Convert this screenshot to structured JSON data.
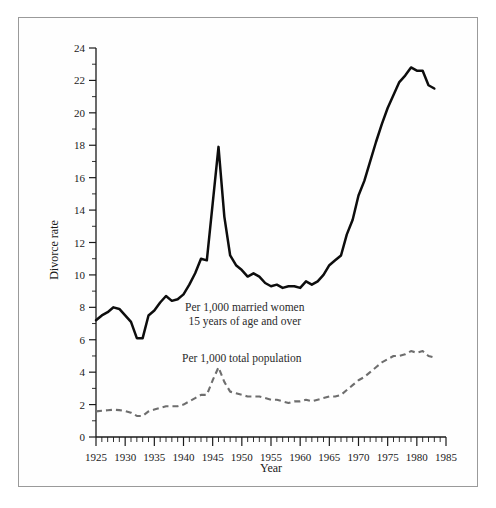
{
  "figure": {
    "frame_border_color": "#9a9a9a",
    "background_color": "#fefefe"
  },
  "chart_data": {
    "type": "line",
    "title": "",
    "xlabel": "Year",
    "ylabel": "Divorce rate",
    "xlim": [
      1925,
      1985
    ],
    "ylim": [
      0,
      24
    ],
    "grid": false,
    "legend_position": "inline-annotation",
    "x_ticks": [
      1925,
      1930,
      1935,
      1940,
      1945,
      1950,
      1955,
      1960,
      1965,
      1970,
      1975,
      1980,
      1985
    ],
    "x_tick_labels": [
      "1925",
      "1930",
      "1935",
      "1940",
      "1945",
      "1950",
      "1955",
      "1960",
      "1965",
      "1970",
      "1975",
      "1980",
      "1985"
    ],
    "x_minor_step": 1,
    "y_ticks": [
      0,
      2,
      4,
      6,
      8,
      10,
      12,
      14,
      16,
      18,
      20,
      22,
      24
    ],
    "y_tick_labels": [
      "0",
      "2",
      "4",
      "6",
      "8",
      "10",
      "12",
      "14",
      "16",
      "18",
      "20",
      "22",
      "24"
    ],
    "y_minor_ticks": [
      1,
      3,
      5,
      7,
      9,
      11,
      13,
      15,
      17,
      19,
      21,
      23
    ],
    "annotations": [
      {
        "id": "annot-married-women",
        "lines": [
          "Per 1,000 married women",
          "15 years of age and over"
        ],
        "x": 1950.5,
        "y": 7.8
      },
      {
        "id": "annot-total-population",
        "lines": [
          "Per 1,000 total population"
        ],
        "x": 1950.0,
        "y": 4.6
      }
    ],
    "series": [
      {
        "name": "Per 1,000 married women 15 years of age and over",
        "style": "solid",
        "color": "#0d0d0d",
        "x": [
          1925,
          1926,
          1927,
          1928,
          1929,
          1930,
          1931,
          1932,
          1933,
          1934,
          1935,
          1936,
          1937,
          1938,
          1939,
          1940,
          1941,
          1942,
          1943,
          1944,
          1945,
          1946,
          1947,
          1948,
          1949,
          1950,
          1951,
          1952,
          1953,
          1954,
          1955,
          1956,
          1957,
          1958,
          1959,
          1960,
          1961,
          1962,
          1963,
          1964,
          1965,
          1966,
          1967,
          1968,
          1969,
          1970,
          1971,
          1972,
          1973,
          1974,
          1975,
          1976,
          1977,
          1978,
          1979,
          1980,
          1981,
          1982,
          1983
        ],
        "values": [
          7.2,
          7.5,
          7.7,
          8.0,
          7.9,
          7.5,
          7.1,
          6.1,
          6.1,
          7.5,
          7.8,
          8.3,
          8.7,
          8.4,
          8.5,
          8.8,
          9.4,
          10.1,
          11.0,
          10.9,
          14.4,
          17.9,
          13.6,
          11.2,
          10.6,
          10.3,
          9.9,
          10.1,
          9.9,
          9.5,
          9.3,
          9.4,
          9.2,
          9.3,
          9.3,
          9.2,
          9.6,
          9.4,
          9.6,
          10.0,
          10.6,
          10.9,
          11.2,
          12.5,
          13.4,
          14.9,
          15.8,
          17.0,
          18.2,
          19.3,
          20.3,
          21.1,
          21.9,
          22.3,
          22.8,
          22.6,
          22.6,
          21.7,
          21.5
        ]
      },
      {
        "name": "Per 1,000 total population",
        "style": "dashed",
        "color": "#6e6e6e",
        "x": [
          1925,
          1926,
          1927,
          1928,
          1929,
          1930,
          1931,
          1932,
          1933,
          1934,
          1935,
          1936,
          1937,
          1938,
          1939,
          1940,
          1941,
          1942,
          1943,
          1944,
          1945,
          1946,
          1947,
          1948,
          1949,
          1950,
          1951,
          1952,
          1953,
          1954,
          1955,
          1956,
          1957,
          1958,
          1959,
          1960,
          1961,
          1962,
          1963,
          1964,
          1965,
          1966,
          1967,
          1968,
          1969,
          1970,
          1971,
          1972,
          1973,
          1974,
          1975,
          1976,
          1977,
          1978,
          1979,
          1980,
          1981,
          1982,
          1983
        ],
        "values": [
          1.58,
          1.62,
          1.65,
          1.68,
          1.66,
          1.6,
          1.5,
          1.3,
          1.3,
          1.58,
          1.7,
          1.8,
          1.9,
          1.9,
          1.9,
          2.0,
          2.2,
          2.4,
          2.6,
          2.6,
          3.5,
          4.3,
          3.4,
          2.8,
          2.7,
          2.6,
          2.5,
          2.5,
          2.5,
          2.4,
          2.3,
          2.3,
          2.2,
          2.1,
          2.2,
          2.2,
          2.3,
          2.2,
          2.3,
          2.4,
          2.5,
          2.5,
          2.6,
          2.9,
          3.2,
          3.5,
          3.7,
          4.0,
          4.3,
          4.6,
          4.8,
          5.0,
          5.0,
          5.1,
          5.3,
          5.2,
          5.3,
          5.0,
          4.9
        ]
      }
    ]
  }
}
